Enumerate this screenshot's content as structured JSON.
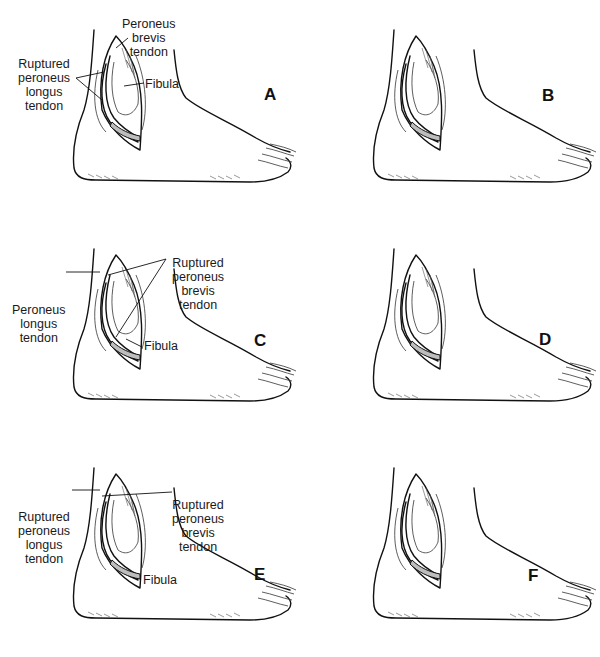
{
  "figure": {
    "panels": [
      {
        "id": "A",
        "letter": "A",
        "labels": {
          "peroneus_brevis": "Peroneus\nbrevis\ntendon",
          "ruptured_longus": "Ruptured\nperoneus\nlongus\ntendon",
          "fibula": "Fibula"
        }
      },
      {
        "id": "B",
        "letter": "B",
        "labels": {}
      },
      {
        "id": "C",
        "letter": "C",
        "labels": {
          "ruptured_brevis": "Ruptured\nperoneus\nbrevis\ntendon",
          "peroneus_longus": "Peroneus\nlongus\ntendon",
          "fibula": "Fibula"
        }
      },
      {
        "id": "D",
        "letter": "D",
        "labels": {}
      },
      {
        "id": "E",
        "letter": "E",
        "labels": {
          "ruptured_longus": "Ruptured\nperoneus\nlongus\ntendon",
          "ruptured_brevis": "Ruptured\nperoneus\nbrevis\ntendon",
          "fibula": "Fibula"
        }
      },
      {
        "id": "F",
        "letter": "F",
        "labels": {}
      }
    ]
  }
}
